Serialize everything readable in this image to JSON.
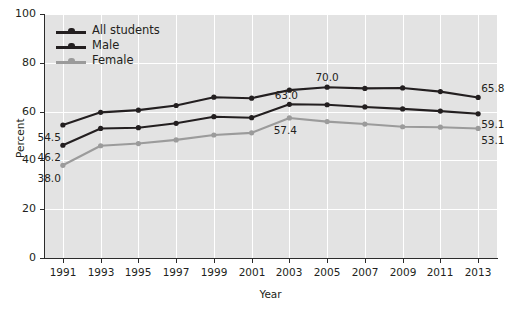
{
  "chart_data": {
    "type": "line",
    "title": "",
    "xlabel": "Year",
    "ylabel": "Percent",
    "grid": true,
    "legend_position": "top-left-inside",
    "categories": [
      1991,
      1993,
      1995,
      1997,
      1999,
      2001,
      2003,
      2005,
      2007,
      2009,
      2011,
      2013
    ],
    "xlim": [
      1990,
      2014
    ],
    "ylim": [
      0,
      100
    ],
    "ytick_labels": [
      "0",
      "20",
      "40",
      "60",
      "80",
      "100"
    ],
    "ytick_values": [
      0,
      20,
      40,
      60,
      80,
      100
    ],
    "xtick_labels": [
      "1991",
      "1993",
      "1995",
      "1997",
      "1999",
      "2001",
      "2003",
      "2005",
      "2007",
      "2009",
      "2011",
      "2013"
    ],
    "series": [
      {
        "name": "Male",
        "color": "#231f20",
        "values": [
          54.5,
          59.7,
          60.6,
          62.5,
          65.9,
          65.5,
          68.8,
          70.0,
          69.5,
          69.7,
          68.2,
          65.8
        ],
        "point_labels": [
          {
            "index": 0,
            "text": "54.5",
            "dx": -2,
            "dy": 13,
            "anchor": "end"
          },
          {
            "index": 7,
            "text": "70.0",
            "dx": 0,
            "dy": -9,
            "anchor": "middle"
          },
          {
            "index": 11,
            "text": "65.8",
            "dx": 3,
            "dy": -8,
            "anchor": "start"
          }
        ]
      },
      {
        "name": "All students",
        "color": "#231f20",
        "values": [
          46.2,
          53.1,
          53.4,
          55.2,
          57.9,
          57.5,
          63.0,
          62.8,
          61.9,
          61.1,
          60.2,
          59.1
        ],
        "point_labels": [
          {
            "index": 0,
            "text": "46.2",
            "dx": -2,
            "dy": 13,
            "anchor": "end"
          },
          {
            "index": 6,
            "text": "63.0",
            "dx": -3,
            "dy": -8,
            "anchor": "middle"
          },
          {
            "index": 11,
            "text": "59.1",
            "dx": 3,
            "dy": 11,
            "anchor": "start"
          }
        ]
      },
      {
        "name": "Female",
        "color": "#9b9b9b",
        "values": [
          38.0,
          46.0,
          46.9,
          48.4,
          50.4,
          51.3,
          57.4,
          55.9,
          54.9,
          53.8,
          53.6,
          53.1
        ],
        "point_labels": [
          {
            "index": 0,
            "text": "38.0",
            "dx": -2,
            "dy": 14,
            "anchor": "end"
          },
          {
            "index": 6,
            "text": "57.4",
            "dx": -4,
            "dy": 13,
            "anchor": "middle"
          },
          {
            "index": 11,
            "text": "53.1",
            "dx": 3,
            "dy": 13,
            "anchor": "start"
          }
        ]
      }
    ],
    "legend": [
      {
        "label": "All students",
        "color": "#231f20"
      },
      {
        "label": "Male",
        "color": "#231f20"
      },
      {
        "label": "Female",
        "color": "#9b9b9b"
      }
    ],
    "colors": {
      "plot_background": "#e3e3e3",
      "gridline": "#ffffff",
      "axis": "#2b2b2b",
      "text": "#231f20",
      "dark_series": "#231f20",
      "light_series": "#9b9b9b"
    }
  }
}
